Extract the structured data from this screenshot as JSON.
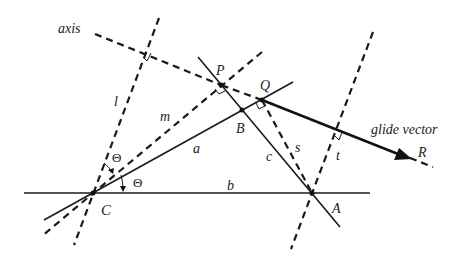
{
  "labels": {
    "axis": "axis",
    "glide_vector": "glide vector",
    "P": "P",
    "Q": "Q",
    "R": "R",
    "B": "B",
    "C": "C",
    "A": "A",
    "a": "a",
    "b": "b",
    "c": "c",
    "l": "l",
    "m": "m",
    "s": "s",
    "t": "t",
    "theta_upper": "Θ",
    "theta_lower": "Θ"
  },
  "colors": {
    "ink": "#1a1a1a",
    "background": "#ffffff"
  },
  "points": {
    "P": [
      221,
      85
    ],
    "Q": [
      262,
      100
    ],
    "B": [
      242,
      110
    ],
    "C": [
      93,
      193
    ],
    "A": [
      312,
      193
    ],
    "R_arrow_tip": [
      410,
      158
    ]
  }
}
